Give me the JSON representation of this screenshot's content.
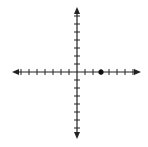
{
  "diagram": {
    "type": "coordinate-plane",
    "x_axis": {
      "min_tick": -7,
      "max_tick": 7,
      "arrows": true
    },
    "y_axis": {
      "min_tick": -7,
      "max_tick": 7,
      "arrows": true
    },
    "points": [
      {
        "x": 3,
        "y": 0,
        "label": ""
      }
    ],
    "colors": {
      "axis": "#222222",
      "point": "#111111",
      "background": "#ffffff"
    }
  },
  "chart_data": {
    "type": "scatter",
    "title": "",
    "xlabel": "",
    "ylabel": "",
    "xlim": [
      -7,
      7
    ],
    "ylim": [
      -7,
      7
    ],
    "grid": false,
    "series": [
      {
        "name": "point",
        "x": [
          3
        ],
        "y": [
          0
        ]
      }
    ]
  }
}
